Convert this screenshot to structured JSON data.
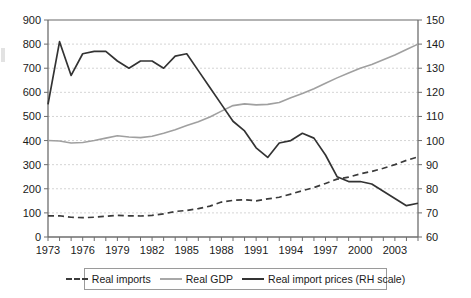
{
  "chart_data": {
    "type": "line",
    "title": "",
    "xlabel": "",
    "ylabel": "",
    "y2label": "",
    "grid": true,
    "legend_position": "bottom",
    "x": [
      1973,
      1974,
      1975,
      1976,
      1977,
      1978,
      1979,
      1980,
      1981,
      1982,
      1983,
      1984,
      1985,
      1986,
      1987,
      1988,
      1989,
      1990,
      1991,
      1992,
      1993,
      1994,
      1995,
      1996,
      1997,
      1998,
      1999,
      2000,
      2001,
      2002,
      2003,
      2004,
      2005
    ],
    "xlim": [
      1973,
      2005
    ],
    "xticks": [
      1973,
      1976,
      1979,
      1982,
      1985,
      1988,
      1991,
      1994,
      1997,
      2000,
      2003
    ],
    "xtick_labels": [
      "1973",
      "1976",
      "1979",
      "1982",
      "1985",
      "1988",
      "1991",
      "1994",
      "1997",
      "2000",
      "2003"
    ],
    "ylim": [
      0,
      900
    ],
    "yticks": [
      0,
      100,
      200,
      300,
      400,
      500,
      600,
      700,
      800,
      900
    ],
    "ytick_labels": [
      "0",
      "100",
      "200",
      "300",
      "400",
      "500",
      "600",
      "700",
      "800",
      "900"
    ],
    "y2lim": [
      60,
      150
    ],
    "y2ticks": [
      60,
      70,
      80,
      90,
      100,
      110,
      120,
      130,
      140,
      150
    ],
    "y2tick_labels": [
      "60",
      "70",
      "80",
      "90",
      "100",
      "110",
      "120",
      "130",
      "140",
      "150"
    ],
    "series": [
      {
        "name": "Real imports",
        "axis": "left",
        "style": "dashed",
        "color": "#3b3b3b",
        "values": [
          88,
          88,
          82,
          80,
          82,
          86,
          90,
          88,
          87,
          90,
          96,
          106,
          110,
          118,
          128,
          145,
          152,
          155,
          150,
          158,
          165,
          178,
          192,
          205,
          222,
          240,
          248,
          262,
          272,
          285,
          300,
          318,
          332
        ]
      },
      {
        "name": "Real GDP",
        "axis": "left",
        "style": "solid",
        "color": "#a0a0a0",
        "values": [
          400,
          398,
          390,
          392,
          400,
          410,
          420,
          415,
          412,
          418,
          430,
          445,
          462,
          478,
          498,
          522,
          545,
          552,
          548,
          550,
          558,
          578,
          595,
          615,
          638,
          660,
          680,
          700,
          715,
          735,
          755,
          778,
          800
        ]
      },
      {
        "name": "Real import prices (RH scale)",
        "axis": "right",
        "style": "solid",
        "color": "#333333",
        "values": [
          115,
          141,
          127,
          136,
          137,
          137,
          133,
          130,
          133,
          133,
          130,
          135,
          136,
          129,
          122,
          115,
          108,
          104,
          97,
          93,
          99,
          100,
          103,
          101,
          94,
          85,
          83,
          83,
          82,
          79,
          76,
          73,
          74
        ]
      }
    ],
    "legend": [
      {
        "label": "Real imports",
        "swatch": "dashed"
      },
      {
        "label": "Real GDP",
        "swatch": "solid-light"
      },
      {
        "label": "Real import prices (RH scale)",
        "swatch": "solid-dark"
      }
    ]
  }
}
